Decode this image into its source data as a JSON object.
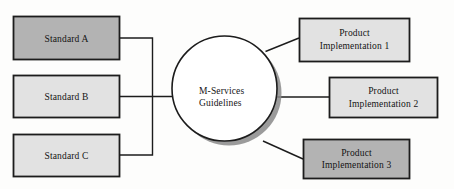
{
  "diagram": {
    "type": "hub-and-spoke",
    "background_color": "#fdfdfc",
    "hub": {
      "name": "m-services-guidelines",
      "line_1": "M-Services",
      "line_2": "Guidelines",
      "shape": "circle",
      "fill_color": "#ffffff",
      "stroke_color": "#1c1c1c",
      "shadow_color": "#6e6e6e"
    },
    "inputs": {
      "group_label": "standards",
      "items": [
        {
          "name": "standard-a",
          "label": "Standard A",
          "fill_color": "#b3b3b3",
          "stroke_color": "#1c1c1c"
        },
        {
          "name": "standard-b",
          "label": "Standard B",
          "fill_color": "#e2e2e2",
          "stroke_color": "#1c1c1c"
        },
        {
          "name": "standard-c",
          "label": "Standard C",
          "fill_color": "#e2e2e2",
          "stroke_color": "#1c1c1c"
        }
      ]
    },
    "outputs": {
      "group_label": "product-implementations",
      "items": [
        {
          "name": "product-implementation-1",
          "line_1": "Product",
          "line_2": "Implementation 1",
          "fill_color": "#e2e2e2",
          "stroke_color": "#1c1c1c"
        },
        {
          "name": "product-implementation-2",
          "line_1": "Product",
          "line_2": "Implementation 2",
          "fill_color": "#e2e2e2",
          "stroke_color": "#1c1c1c"
        },
        {
          "name": "product-implementation-3",
          "line_1": "Product",
          "line_2": "Implementation 3",
          "fill_color": "#b3b3b3",
          "stroke_color": "#1c1c1c"
        }
      ]
    },
    "connector_color": "#1c1c1c"
  }
}
